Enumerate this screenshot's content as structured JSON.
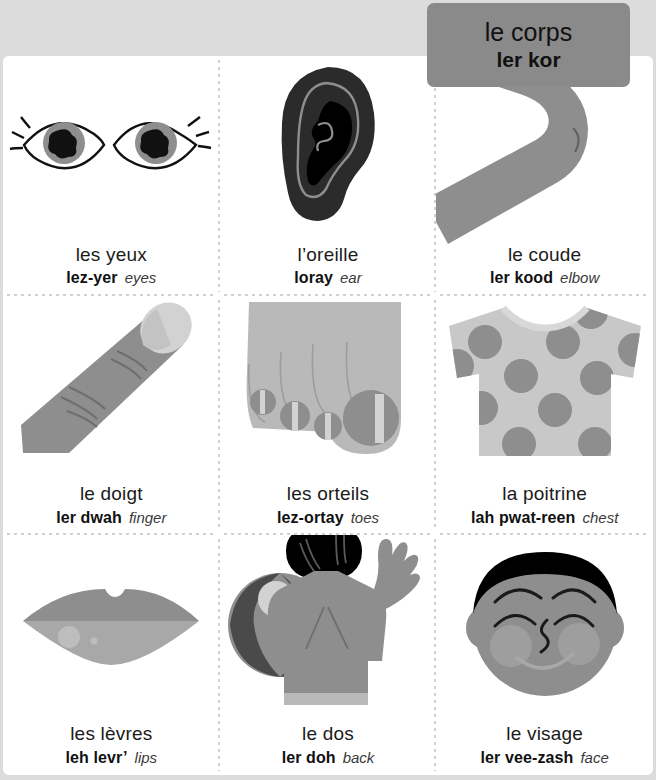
{
  "banner": {
    "title_fr": "le corps",
    "title_pron": "ler kor"
  },
  "colors": {
    "background": "#dcdcdc",
    "page": "#ffffff",
    "banner": "#8a8a8a",
    "mid_gray": "#8e8e8e",
    "light_gray": "#b9b9b9",
    "pale_gray": "#d2d2d2",
    "dark": "#2b2b2b",
    "black": "#000000",
    "text": "#1a1a1a",
    "divider": "#cfcfcf"
  },
  "cells": [
    {
      "id": "eyes",
      "fr": "les yeux",
      "pron": "lez-yer",
      "en": "eyes",
      "art": "eyes-illustration"
    },
    {
      "id": "ear",
      "fr": "l’oreille",
      "pron": "loray",
      "en": "ear",
      "art": "ear-illustration"
    },
    {
      "id": "elbow",
      "fr": "le coude",
      "pron": "ler kood",
      "en": "elbow",
      "art": "elbow-illustration"
    },
    {
      "id": "finger",
      "fr": "le doigt",
      "pron": "ler dwah",
      "en": "finger",
      "art": "finger-illustration"
    },
    {
      "id": "toes",
      "fr": "les orteils",
      "pron": "lez-ortay",
      "en": "toes",
      "art": "toes-illustration"
    },
    {
      "id": "chest",
      "fr": "la poitrine",
      "pron": "lah pwat-reen",
      "en": "chest",
      "art": "chest-illustration"
    },
    {
      "id": "lips",
      "fr": "les lèvres",
      "pron": "leh levr’",
      "en": "lips",
      "art": "lips-illustration"
    },
    {
      "id": "back",
      "fr": "le dos",
      "pron": "ler doh",
      "en": "back",
      "art": "back-illustration"
    },
    {
      "id": "face",
      "fr": "le visage",
      "pron": "ler vee-zash",
      "en": "face",
      "art": "face-illustration"
    }
  ]
}
